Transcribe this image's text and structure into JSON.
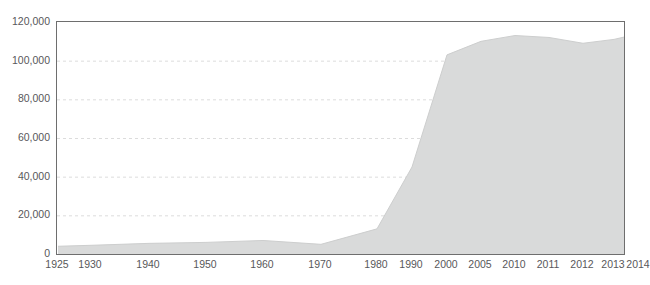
{
  "chart_data": {
    "type": "area",
    "title": "",
    "subtitle": "",
    "xlabel": "",
    "ylabel": "",
    "grid": true,
    "legend": false,
    "legend_position": "none",
    "series_color": "#d9dada",
    "axis_color": "#6e6e6e",
    "grid_color": "#dcdcdc",
    "tick_label_color": "#58585a",
    "categories": [
      "1925",
      "1930",
      "1940",
      "1950",
      "1960",
      "1970",
      "1980",
      "1990",
      "2000",
      "2005",
      "2010",
      "2011",
      "2012",
      "2013",
      "2014"
    ],
    "x": [
      1925,
      1930,
      1940,
      1950,
      1960,
      1970,
      1980,
      1990,
      2000,
      2005,
      2010,
      2011,
      2012,
      2013,
      2014
    ],
    "values": [
      4000,
      4500,
      5500,
      6000,
      7000,
      5000,
      13000,
      45000,
      103000,
      110000,
      113000,
      112000,
      109000,
      111000,
      114000
    ],
    "series": [
      {
        "name": "",
        "values": [
          4000,
          4500,
          5500,
          6000,
          7000,
          5000,
          13000,
          45000,
          103000,
          110000,
          113000,
          112000,
          109000,
          111000,
          114000
        ]
      }
    ],
    "ylim": [
      0,
      120000
    ],
    "yticks": [
      0,
      20000,
      40000,
      60000,
      80000,
      100000,
      120000
    ],
    "ytick_labels": [
      "0",
      "20,000",
      "40,000",
      "60,000",
      "80,000",
      "100,000",
      "120,000"
    ],
    "xtick_labels": [
      "1925",
      "1930",
      "1940",
      "1950",
      "1960",
      "1970",
      "1980",
      "1990",
      "2000",
      "2005",
      "2010",
      "2011",
      "2012",
      "2013",
      "2014"
    ],
    "xtick_positions_px": [
      57,
      90,
      148,
      205,
      262,
      320,
      376,
      411,
      446,
      480,
      514,
      548,
      582,
      613,
      638
    ],
    "annotations": []
  },
  "axes": {
    "y_labels": [
      {
        "label": "120,000",
        "value": 120000
      },
      {
        "label": "100,000",
        "value": 100000
      },
      {
        "label": "80,000",
        "value": 80000
      },
      {
        "label": "60,000",
        "value": 60000
      },
      {
        "label": "40,000",
        "value": 40000
      },
      {
        "label": "20,000",
        "value": 20000
      },
      {
        "label": "0",
        "value": 0
      }
    ],
    "x_labels": [
      {
        "label": "1925"
      },
      {
        "label": "1930"
      },
      {
        "label": "1940"
      },
      {
        "label": "1950"
      },
      {
        "label": "1960"
      },
      {
        "label": "1970"
      },
      {
        "label": "1980"
      },
      {
        "label": "1990"
      },
      {
        "label": "2000"
      },
      {
        "label": "2005"
      },
      {
        "label": "2010"
      },
      {
        "label": "2011"
      },
      {
        "label": "2012"
      },
      {
        "label": "2013"
      },
      {
        "label": "2014"
      }
    ]
  }
}
